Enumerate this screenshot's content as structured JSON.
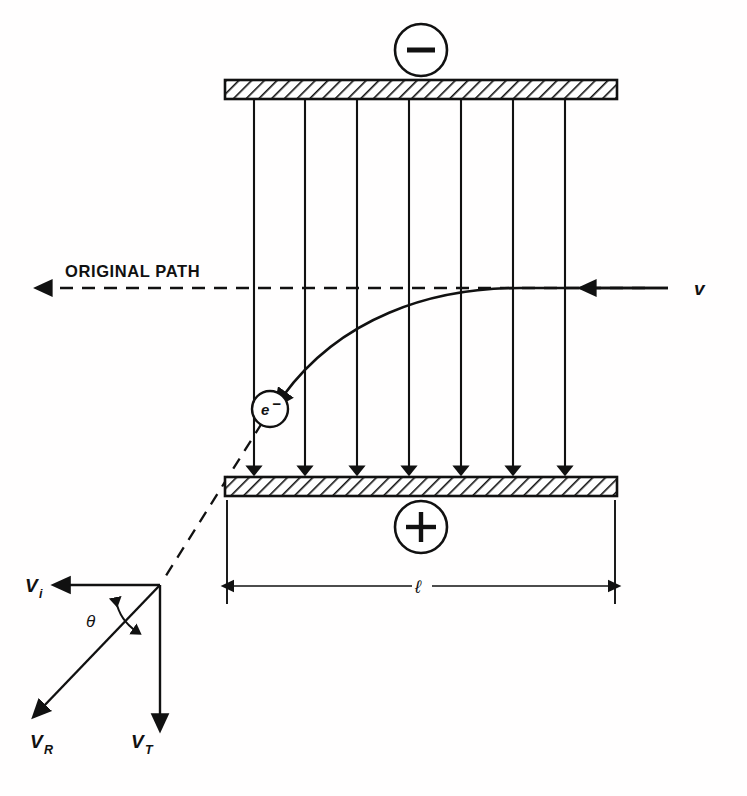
{
  "figure": {
    "background_color": "#fffefe",
    "ink_color": "#111111"
  },
  "labels": {
    "top_plate_charge": "−",
    "bottom_plate_charge": "+",
    "original_path": "ORIGINAL PATH",
    "incoming_velocity": "v",
    "electron": "e",
    "electron_charge_superscript": "−",
    "plate_length": "ℓ",
    "vector_initial": "V",
    "vector_initial_sub": "i",
    "vector_resultant": "V",
    "vector_resultant_sub": "R",
    "vector_transverse": "V",
    "vector_transverse_sub": "T",
    "angle": "θ"
  },
  "geometry": {
    "top_plate": {
      "x": 225,
      "y": 80,
      "width": 392,
      "height": 19
    },
    "bottom_plate": {
      "x": 225,
      "y": 477,
      "width": 392,
      "height": 19
    },
    "field_line_count": 7,
    "field_line_x": [
      254,
      305,
      357,
      409,
      461,
      513,
      565
    ],
    "field_line_top_y": 99,
    "field_line_bottom_y": 477,
    "original_path_y": 288,
    "original_path_x_start": 40,
    "original_path_x_end": 660,
    "electron_circle": {
      "cx": 270,
      "cy": 409,
      "r": 18
    },
    "plus_circle": {
      "cx": 421,
      "cy": 527,
      "r": 26
    },
    "minus_circle": {
      "cx": 421,
      "cy": 50,
      "r": 26
    },
    "dimension_line_y": 586,
    "dimension_x_left": 227,
    "dimension_x_right": 615,
    "vector_origin": {
      "x": 160,
      "y": 585
    },
    "vector_vi_tip": {
      "x": 63,
      "y": 585
    },
    "vector_vt_tip": {
      "x": 160,
      "y": 722
    },
    "vector_vr_tip": {
      "x": 38,
      "y": 712
    }
  },
  "annotations": {
    "description": "Electron enters from the right with velocity v along the original path, is deflected downward toward the positively charged lower plate, and exits with resultant velocity V_R composed of V_i and V_T separated by angle theta."
  }
}
